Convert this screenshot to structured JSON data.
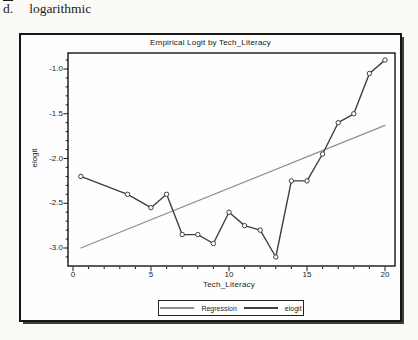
{
  "page": {
    "item_label": "d.",
    "item_text": "logarithmic"
  },
  "chart_data": {
    "type": "line",
    "title": "Empirical Logit by Tech_Literacy",
    "xlabel": "Tech_Literacy",
    "ylabel": "elogit",
    "xlim": [
      -0.3,
      20.6
    ],
    "ylim": [
      -3.2,
      -0.82
    ],
    "x_ticks": [
      0,
      5,
      10,
      15,
      20
    ],
    "y_ticks": [
      -1.0,
      -1.5,
      -2.0,
      -2.5,
      -3.0
    ],
    "x_minor_step": 1,
    "y_minor_step": 0.1,
    "grid": false,
    "legend_position": "bottom-center",
    "axis_color": "#141414",
    "background_color": "#fefefe",
    "series": [
      {
        "name": "Regression",
        "style": "straight-line",
        "color": "#8f8f8f",
        "markers": false,
        "x": [
          0.5,
          20
        ],
        "y": [
          -3.0,
          -1.63
        ]
      },
      {
        "name": "elogit",
        "style": "line-with-circle-markers",
        "color": "#3f3f3f",
        "markers": true,
        "x": [
          0.5,
          3.5,
          5,
          6,
          7,
          8,
          9,
          10,
          11,
          12,
          13,
          14,
          15,
          16,
          17,
          18,
          19,
          20
        ],
        "y": [
          -2.2,
          -2.4,
          -2.55,
          -2.4,
          -2.85,
          -2.85,
          -2.95,
          -2.6,
          -2.75,
          -2.8,
          -3.1,
          -2.25,
          -2.25,
          -1.95,
          -1.6,
          -1.5,
          -1.05,
          -0.9
        ]
      }
    ]
  }
}
